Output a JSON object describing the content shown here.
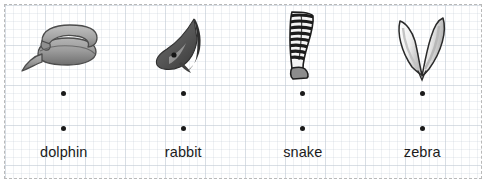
{
  "worksheet": {
    "background_style": "graph-paper",
    "border_color": "#b9b9b9",
    "grid_color": "#c6ced8",
    "dot_color": "#1a1a1a",
    "text_color": "#1b1b1b"
  },
  "columns": [
    {
      "image_name": "coiled-snake-image",
      "image_alt": "coiled snake",
      "dot_top": "•",
      "dot_bottom": "•",
      "label": "dolphin"
    },
    {
      "image_name": "dolphin-image",
      "image_alt": "dolphin",
      "dot_top": "•",
      "dot_bottom": "•",
      "label": "rabbit"
    },
    {
      "image_name": "zebra-leg-image",
      "image_alt": "striped zebra leg",
      "dot_top": "•",
      "dot_bottom": "•",
      "label": "snake"
    },
    {
      "image_name": "rabbit-ears-image",
      "image_alt": "rabbit ears",
      "dot_top": "•",
      "dot_bottom": "•",
      "label": "zebra"
    }
  ]
}
